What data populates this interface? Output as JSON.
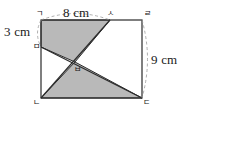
{
  "figure": {
    "type": "geometry-diagram",
    "colors": {
      "stroke": "#2b2b2b",
      "shade_fill": "#b9b9b9",
      "shade_stroke": "#2b2b2b",
      "arc_dash": "#9a9a9a",
      "background": "#ffffff"
    },
    "dimension_labels": [
      {
        "id": "top",
        "text": "8 cm"
      },
      {
        "id": "left",
        "text": "3 cm"
      },
      {
        "id": "right",
        "text": "9 cm"
      }
    ],
    "vertex_labels": [
      {
        "id": "a",
        "text": "ㄱ"
      },
      {
        "id": "s",
        "text": "ㅅ"
      },
      {
        "id": "r",
        "text": "ㄹ"
      },
      {
        "id": "m",
        "text": "ㅁ"
      },
      {
        "id": "b",
        "text": "ㅂ"
      },
      {
        "id": "n",
        "text": "ㄴ"
      },
      {
        "id": "d",
        "text": "ㄷ"
      }
    ],
    "points": {
      "a": {
        "x": 41,
        "y": 20
      },
      "s": {
        "x": 110,
        "y": 20
      },
      "r": {
        "x": 142,
        "y": 20
      },
      "m": {
        "x": 41,
        "y": 47
      },
      "b": {
        "x": 75,
        "y": 62
      },
      "n": {
        "x": 41,
        "y": 98
      },
      "d": {
        "x": 142,
        "y": 98
      }
    },
    "shaded_regions": [
      {
        "id": "upper-left-quad",
        "points": "41,20 110,20 75,62 41,47"
      },
      {
        "id": "lower-triangle",
        "points": "41,98 142,98 75,62"
      }
    ],
    "lines": [
      {
        "id": "segment-m-d",
        "from": "m",
        "to": "d"
      },
      {
        "id": "segment-n-s",
        "from": "n",
        "to": "s"
      }
    ],
    "arcs": [
      {
        "id": "arc-top-8cm",
        "from": "a",
        "to": "s"
      },
      {
        "id": "arc-left-3cm",
        "from": "a",
        "to": "m"
      },
      {
        "id": "arc-right-9cm",
        "from": "r",
        "to": "d"
      }
    ]
  },
  "answer": {
    "open_paren": "(",
    "close_paren": ")",
    "value": ""
  }
}
